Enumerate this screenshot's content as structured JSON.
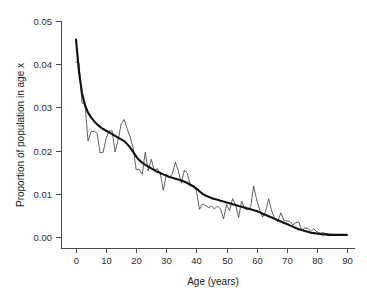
{
  "chart_data": {
    "type": "line",
    "title": "",
    "xlabel": "Age (years)",
    "ylabel": "Proportion of population in age x",
    "xlim": [
      -1,
      93
    ],
    "ylim": [
      0.0,
      0.05
    ],
    "grid": false,
    "legend": "none",
    "xticks": [
      0,
      10,
      20,
      30,
      40,
      50,
      60,
      70,
      80,
      90
    ],
    "xticklabels": [
      "0",
      "10",
      "20",
      "30",
      "40",
      "50",
      "60",
      "70",
      "80",
      "90"
    ],
    "yticks": [
      0.0,
      0.01,
      0.02,
      0.03,
      0.04,
      0.05
    ],
    "yticklabels": [
      "0.00",
      "0.01",
      "0.02",
      "0.03",
      "0.04",
      "0.05"
    ],
    "x": [
      0,
      1,
      2,
      3,
      4,
      5,
      6,
      7,
      8,
      9,
      10,
      11,
      12,
      13,
      14,
      15,
      16,
      17,
      18,
      19,
      20,
      21,
      22,
      23,
      24,
      25,
      26,
      27,
      28,
      29,
      30,
      31,
      32,
      33,
      34,
      35,
      36,
      37,
      38,
      39,
      40,
      41,
      42,
      43,
      44,
      45,
      46,
      47,
      48,
      49,
      50,
      51,
      52,
      53,
      54,
      55,
      56,
      57,
      58,
      59,
      60,
      61,
      62,
      63,
      64,
      65,
      66,
      67,
      68,
      69,
      70,
      71,
      72,
      73,
      74,
      75,
      76,
      77,
      78,
      79,
      80,
      81,
      82,
      83,
      84,
      85,
      86,
      87,
      88,
      89,
      90
    ],
    "series": [
      {
        "name": "Observed proportion",
        "style": "thin-jagged",
        "color": "#3a3a3a",
        "values": [
          0.0405,
          0.0403,
          0.031,
          0.0307,
          0.0223,
          0.0243,
          0.0245,
          0.024,
          0.0195,
          0.0196,
          0.0228,
          0.0245,
          0.0246,
          0.0197,
          0.0225,
          0.0262,
          0.0272,
          0.025,
          0.0232,
          0.0205,
          0.0155,
          0.0157,
          0.0145,
          0.0196,
          0.0153,
          0.018,
          0.0155,
          0.0158,
          0.0147,
          0.0108,
          0.0146,
          0.0138,
          0.0146,
          0.0173,
          0.0153,
          0.0125,
          0.0155,
          0.0147,
          0.0118,
          0.012,
          0.0106,
          0.0064,
          0.0076,
          0.0073,
          0.0068,
          0.0071,
          0.0065,
          0.0072,
          0.0065,
          0.0042,
          0.0075,
          0.0061,
          0.0089,
          0.0074,
          0.0045,
          0.0083,
          0.0066,
          0.0063,
          0.007,
          0.0118,
          0.0086,
          0.0063,
          0.0046,
          0.006,
          0.0088,
          0.006,
          0.0042,
          0.0035,
          0.0056,
          0.0039,
          0.0037,
          0.0036,
          0.0028,
          0.0033,
          0.0035,
          0.0015,
          0.0021,
          0.002,
          0.0013,
          0.0019,
          0.0012,
          0.0009,
          0.001,
          0.0008,
          0.0007,
          0.0006,
          0.0006,
          0.0005,
          0.0005,
          0.0004,
          0.0004
        ]
      },
      {
        "name": "Smoothed fit",
        "style": "thick-smooth",
        "color": "#111111",
        "values": [
          0.0457,
          0.0382,
          0.0333,
          0.0305,
          0.0288,
          0.0277,
          0.0268,
          0.0261,
          0.0255,
          0.025,
          0.0246,
          0.0242,
          0.0238,
          0.0234,
          0.023,
          0.0226,
          0.0222,
          0.0215,
          0.0207,
          0.0197,
          0.0186,
          0.0178,
          0.0172,
          0.0167,
          0.0163,
          0.0159,
          0.0155,
          0.0151,
          0.0148,
          0.0145,
          0.0142,
          0.0139,
          0.0137,
          0.0135,
          0.0133,
          0.0131,
          0.0128,
          0.0125,
          0.0121,
          0.0117,
          0.0112,
          0.0106,
          0.01,
          0.0096,
          0.0093,
          0.009,
          0.0088,
          0.0086,
          0.0084,
          0.0082,
          0.008,
          0.0078,
          0.0076,
          0.0074,
          0.0072,
          0.007,
          0.0068,
          0.0066,
          0.0064,
          0.0062,
          0.006,
          0.0057,
          0.0054,
          0.0051,
          0.0048,
          0.0045,
          0.0042,
          0.0039,
          0.0036,
          0.0033,
          0.003,
          0.0027,
          0.0024,
          0.0021,
          0.0018,
          0.0016,
          0.0014,
          0.0012,
          0.001,
          0.0009,
          0.0008,
          0.0007,
          0.0006,
          0.0006,
          0.0005,
          0.0005,
          0.0005,
          0.0005,
          0.0005,
          0.0005,
          0.0005
        ]
      }
    ]
  }
}
